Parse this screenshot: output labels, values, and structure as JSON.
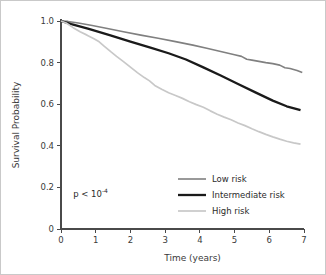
{
  "chart_data": {
    "type": "line",
    "title": "",
    "xlabel": "Time (years)",
    "ylabel": "Survival Probability",
    "xlim": [
      0,
      7
    ],
    "ylim": [
      0,
      1.0
    ],
    "xticks": [
      "0",
      "1",
      "2",
      "3",
      "4",
      "5",
      "6",
      "7"
    ],
    "xtick_values": [
      0,
      1,
      2,
      3,
      4,
      5,
      6,
      7
    ],
    "yticks": [
      "0",
      "0.2",
      "0.4",
      "0.6",
      "0.8",
      "1.0"
    ],
    "ytick_values": [
      0,
      0.2,
      0.4,
      0.6,
      0.8,
      1.0
    ],
    "grid": false,
    "legend_position": "lower right",
    "annotations": [
      {
        "name": "p-value",
        "text_prefix": "p < 10",
        "text_superscript": "-4",
        "x": 0.35,
        "y": 0.155
      }
    ],
    "series": [
      {
        "name": "Low risk",
        "color": "#808080",
        "width": 1.6,
        "x": [
          0,
          0.2,
          0.5,
          0.9,
          1.3,
          1.8,
          2.3,
          2.8,
          3.3,
          3.8,
          4.2,
          4.6,
          5.0,
          5.2,
          5.35,
          5.5,
          5.7,
          5.9,
          6.1,
          6.3,
          6.45,
          6.6,
          6.8,
          6.95
        ],
        "y": [
          1.0,
          0.998,
          0.99,
          0.978,
          0.965,
          0.948,
          0.932,
          0.917,
          0.901,
          0.884,
          0.869,
          0.853,
          0.838,
          0.83,
          0.816,
          0.812,
          0.806,
          0.8,
          0.795,
          0.788,
          0.775,
          0.772,
          0.762,
          0.752
        ]
      },
      {
        "name": "Intermediate risk",
        "color": "#1a1a1a",
        "width": 2.3,
        "x": [
          0,
          0.3,
          0.8,
          1.4,
          2.0,
          2.6,
          3.1,
          3.6,
          4.1,
          4.6,
          5.1,
          5.6,
          6.1,
          6.5,
          6.9
        ],
        "y": [
          1.0,
          0.985,
          0.962,
          0.932,
          0.901,
          0.871,
          0.845,
          0.815,
          0.777,
          0.738,
          0.697,
          0.657,
          0.617,
          0.59,
          0.571
        ]
      },
      {
        "name": "High risk",
        "color": "#c8c8c8",
        "width": 1.7,
        "x": [
          0,
          0.15,
          0.35,
          0.55,
          0.75,
          0.95,
          1.1,
          1.25,
          1.45,
          1.6,
          1.8,
          2.0,
          2.2,
          2.4,
          2.55,
          2.7,
          2.9,
          3.1,
          3.3,
          3.5,
          3.7,
          3.9,
          4.1,
          4.3,
          4.5,
          4.7,
          4.9,
          5.1,
          5.3,
          5.5,
          5.7,
          5.9,
          6.1,
          6.3,
          6.5,
          6.7,
          6.9
        ],
        "y": [
          1.0,
          0.99,
          0.968,
          0.948,
          0.932,
          0.915,
          0.9,
          0.878,
          0.85,
          0.83,
          0.805,
          0.778,
          0.752,
          0.728,
          0.712,
          0.69,
          0.672,
          0.655,
          0.642,
          0.628,
          0.612,
          0.598,
          0.585,
          0.568,
          0.552,
          0.538,
          0.525,
          0.51,
          0.497,
          0.482,
          0.468,
          0.455,
          0.443,
          0.432,
          0.422,
          0.414,
          0.408
        ]
      }
    ],
    "legend": [
      {
        "label": "Low risk",
        "color": "#808080",
        "width": 1.6
      },
      {
        "label": "Intermediate risk",
        "color": "#1a1a1a",
        "width": 2.3
      },
      {
        "label": "High risk",
        "color": "#c8c8c8",
        "width": 1.7
      }
    ]
  }
}
